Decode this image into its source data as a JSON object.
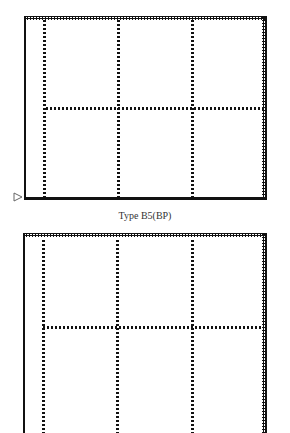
{
  "diagrams": [
    {
      "caption": "Type B5(BP)",
      "columns": 3,
      "rows": 2,
      "marker_icon": "triangle-right-outline"
    },
    {
      "caption": "",
      "columns": 3,
      "rows": 2
    }
  ],
  "colors": {
    "line": "#111111",
    "background": "#ffffff",
    "caption": "#333333"
  }
}
